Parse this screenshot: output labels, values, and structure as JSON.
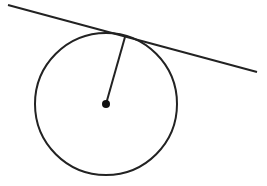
{
  "diagram": {
    "stroke_color": "#222222",
    "background": "#ffffff",
    "circle": {
      "cx": 106,
      "cy": 104,
      "r": 71
    },
    "center": {
      "cx": 106,
      "cy": 104,
      "r": 4
    },
    "radius_segment": {
      "x1": 106,
      "y1": 104,
      "x2": 125,
      "y2": 37
    },
    "tangent_line": {
      "x1": 8,
      "y1": 5,
      "x2": 257,
      "y2": 72
    }
  }
}
